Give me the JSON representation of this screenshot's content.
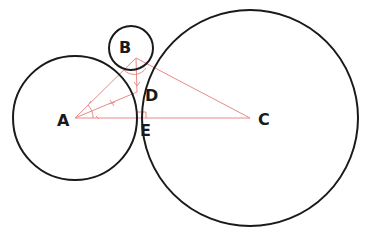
{
  "diagram": {
    "colors": {
      "circle_stroke": "#1a1a1a",
      "construction": "#e88a8a",
      "background": "#ffffff"
    },
    "circles": [
      {
        "id": "A",
        "cx": 75,
        "cy": 118,
        "r": 62
      },
      {
        "id": "B",
        "cx": 131,
        "cy": 48,
        "r": 22
      },
      {
        "id": "C",
        "cx": 250,
        "cy": 118,
        "r": 108
      }
    ],
    "points": {
      "A": {
        "label": "A",
        "x": 75,
        "y": 118
      },
      "B": {
        "label": "B",
        "x": 136,
        "y": 58
      },
      "C": {
        "label": "C",
        "x": 250,
        "y": 118
      },
      "D": {
        "label": "D",
        "x": 137,
        "y": 90
      },
      "E": {
        "label": "E",
        "x": 138,
        "y": 118
      }
    },
    "labels": [
      {
        "text": "A",
        "x": 57,
        "y": 126
      },
      {
        "text": "B",
        "x": 119,
        "y": 53
      },
      {
        "text": "C",
        "x": 258,
        "y": 125
      },
      {
        "text": "D",
        "x": 145,
        "y": 101
      },
      {
        "text": "E",
        "x": 140,
        "y": 136
      }
    ],
    "construction_lines": [
      {
        "from": "A",
        "to": "B"
      },
      {
        "from": "A",
        "to": "C"
      },
      {
        "from": "B",
        "to": "C"
      },
      {
        "from": "A",
        "to": "D"
      },
      {
        "from": "B",
        "to": "D"
      }
    ],
    "annotations": [
      "angle-bisector-marks at A",
      "right-angle mark at E",
      "arc mark at B"
    ]
  }
}
